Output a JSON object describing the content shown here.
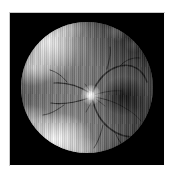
{
  "page": {
    "title": "Retinal Fundus Photograph",
    "background_color": "#ffffff",
    "width": 173,
    "height": 176
  },
  "panel": {
    "name": "fundus-image-panel",
    "background_color": "#000000",
    "border_color": "#c9c9c9",
    "left": 10,
    "top": 13,
    "width": 154,
    "height": 152,
    "caption": ""
  },
  "image": {
    "modality": "fundus-photography",
    "color_mode": "grayscale",
    "artifact": "vertical scan-line striping",
    "fundus_circle": {
      "center_x": 87,
      "center_y": 88,
      "radius": 66,
      "rim_color": "#000000"
    },
    "features": [
      {
        "id": "optic-disc",
        "label": "Optic disc",
        "x": 92,
        "y": 95,
        "brightness": "bright",
        "color": "#ebebeb"
      },
      {
        "id": "macula",
        "label": "Macula",
        "x": 116,
        "y": 96,
        "brightness": "dark",
        "color": "#141414"
      },
      {
        "id": "lesion-upper-left",
        "label": "Bright lesion, superior nasal",
        "x": 55,
        "y": 48,
        "brightness": "bright",
        "color": "#e1e1e1"
      },
      {
        "id": "lesion-lower-left",
        "label": "Bright lesion, inferior nasal",
        "x": 62,
        "y": 128,
        "brightness": "bright",
        "color": "#e8e8e8"
      },
      {
        "id": "flecks-upper-right",
        "label": "Faint flecks, superior temporal",
        "x": 123,
        "y": 42,
        "brightness": "faint",
        "color": "#c8c8c8"
      }
    ],
    "vessels": {
      "label": "Retinal vascular arcades",
      "color": "#0d0d0d",
      "origin": "optic-disc"
    }
  }
}
